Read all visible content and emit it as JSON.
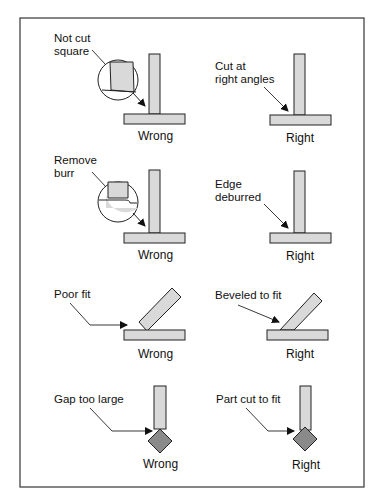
{
  "panels": [
    {
      "row": 1,
      "side": "wrong",
      "annotation": [
        "Not cut",
        "square"
      ],
      "caption": "Wrong"
    },
    {
      "row": 1,
      "side": "right",
      "annotation": [
        "Cut at",
        "right angles"
      ],
      "caption": "Right"
    },
    {
      "row": 2,
      "side": "wrong",
      "annotation": [
        "Remove",
        "burr"
      ],
      "caption": "Wrong"
    },
    {
      "row": 2,
      "side": "right",
      "annotation": [
        "Edge",
        "deburred"
      ],
      "caption": "Right"
    },
    {
      "row": 3,
      "side": "wrong",
      "annotation": [
        "Poor fit"
      ],
      "caption": "Wrong"
    },
    {
      "row": 3,
      "side": "right",
      "annotation": [
        "Beveled to fit"
      ],
      "caption": "Right"
    },
    {
      "row": 4,
      "side": "wrong",
      "annotation": [
        "Gap too large"
      ],
      "caption": "Wrong"
    },
    {
      "row": 4,
      "side": "right",
      "annotation": [
        "Part cut to fit"
      ],
      "caption": "Right"
    }
  ],
  "colors": {
    "part_fill": "#d9d9d9",
    "fitting_fill": "#8a8a8a",
    "stroke": "#222222",
    "border": "#444444"
  }
}
